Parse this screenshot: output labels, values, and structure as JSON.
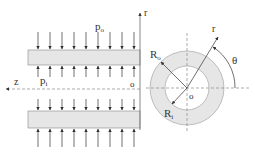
{
  "diagram": {
    "colors": {
      "line": "#333333",
      "wall_fill": "#e6e6e6",
      "dash": "#888888"
    },
    "labels": {
      "outer_pressure": "p",
      "outer_pressure_sub": "o",
      "inner_pressure": "p",
      "inner_pressure_sub": "i",
      "axial_axis": "z",
      "radial_axis": "r",
      "origin_left": "o",
      "origin_right": "o",
      "outer_radius": "R",
      "outer_radius_sub": "o",
      "inner_radius": "R",
      "inner_radius_sub": "i",
      "radial_coord": "r",
      "angle": "θ"
    },
    "arrows_x": [
      38,
      50,
      62,
      74,
      86,
      98,
      110,
      122,
      134
    ]
  }
}
